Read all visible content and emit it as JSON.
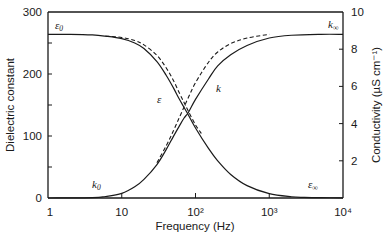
{
  "chart_data": {
    "type": "line",
    "title": "",
    "xlabel": "Frequency (Hz)",
    "ylabel": "Dielectric constant",
    "y2label": "Conductivity (µS cm⁻¹)",
    "xscale": "log",
    "xlim": [
      1,
      10000
    ],
    "ylim": [
      0,
      300
    ],
    "y2lim": [
      0,
      10
    ],
    "grid": false,
    "legend": "none",
    "x_ticks": [
      {
        "value": 1,
        "label": "1"
      },
      {
        "value": 10,
        "label": "10"
      },
      {
        "value": 100,
        "label": "10²"
      },
      {
        "value": 1000,
        "label": "10³"
      },
      {
        "value": 10000,
        "label": "10⁴"
      }
    ],
    "y_ticks": [
      {
        "value": 0,
        "label": "0"
      },
      {
        "value": 50,
        "label": ""
      },
      {
        "value": 100,
        "label": "100"
      },
      {
        "value": 150,
        "label": ""
      },
      {
        "value": 200,
        "label": "200"
      },
      {
        "value": 250,
        "label": ""
      },
      {
        "value": 300,
        "label": "300"
      }
    ],
    "y2_ticks": [
      {
        "value": 2,
        "label": "2"
      },
      {
        "value": 4,
        "label": "4"
      },
      {
        "value": 6,
        "label": "6"
      },
      {
        "value": 8,
        "label": "8"
      },
      {
        "value": 10,
        "label": "10"
      }
    ],
    "series": [
      {
        "name": "ε (solid)",
        "axis": "left",
        "style": "solid",
        "x": [
          1,
          2,
          4,
          6,
          10,
          15,
          20,
          30,
          40,
          50,
          60,
          70,
          80,
          100,
          150,
          200,
          300,
          500,
          1000,
          2000,
          3000,
          5000,
          10000
        ],
        "y": [
          264,
          264,
          263,
          261,
          257,
          250,
          241,
          220,
          198,
          178,
          160,
          146,
          134,
          113,
          80,
          60,
          38,
          20,
          7,
          2,
          1,
          0.5,
          0.3
        ]
      },
      {
        "name": "ε (dashed)",
        "axis": "left",
        "style": "dashed",
        "x": [
          6,
          10,
          15,
          20,
          30,
          40,
          50,
          60,
          70,
          80,
          100,
          120
        ],
        "y": [
          261,
          259,
          254,
          247,
          230,
          210,
          190,
          170,
          154,
          140,
          118,
          104
        ]
      },
      {
        "name": "k (solid)",
        "axis": "right",
        "style": "solid",
        "x": [
          1,
          4,
          6,
          10,
          15,
          20,
          30,
          40,
          50,
          60,
          70,
          80,
          100,
          150,
          200,
          300,
          500,
          1000,
          2000,
          5000,
          10000
        ],
        "y": [
          0,
          0.02,
          0.08,
          0.25,
          0.6,
          1.0,
          1.8,
          2.6,
          3.3,
          3.85,
          4.3,
          4.6,
          5.3,
          6.4,
          7.1,
          7.7,
          8.2,
          8.6,
          8.75,
          8.8,
          8.8
        ]
      },
      {
        "name": "k (dashed)",
        "axis": "right",
        "style": "dashed",
        "x": [
          30,
          40,
          50,
          60,
          70,
          80,
          100,
          150,
          200,
          300,
          500,
          1000
        ],
        "y": [
          1.9,
          2.8,
          3.6,
          4.3,
          4.9,
          5.4,
          6.2,
          7.3,
          7.85,
          8.3,
          8.6,
          8.8
        ]
      }
    ],
    "annotations": [
      {
        "id": "eps0",
        "text": "ε",
        "sub": "0",
        "meaning": "static dielectric constant ~264"
      },
      {
        "id": "kinf",
        "text": "k",
        "sub": "∞",
        "meaning": "high-frequency conductivity ~8.8"
      },
      {
        "id": "eps",
        "text": "ε",
        "sub": ""
      },
      {
        "id": "k",
        "text": "k",
        "sub": ""
      },
      {
        "id": "k0",
        "text": "k",
        "sub": "0"
      },
      {
        "id": "epsinf",
        "text": "ε",
        "sub": "∞"
      }
    ]
  },
  "labels": {
    "xlabel": "Frequency (Hz)",
    "ylabel": "Dielectric constant",
    "y2label": "Conductivity (µS cm⁻¹)",
    "eps0": "ε",
    "eps0_sub": "0",
    "kinf": "k",
    "kinf_sub": "∞",
    "eps": "ε",
    "k": "k",
    "k0": "k",
    "k0_sub": "0",
    "epsinf": "ε",
    "epsinf_sub": "∞"
  }
}
